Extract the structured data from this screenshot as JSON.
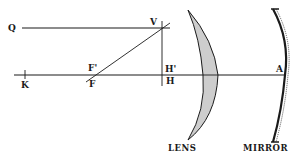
{
  "diagram": {
    "type": "optics ray diagram",
    "labels": {
      "Q": "Q",
      "V": "V",
      "F_prime": "F'",
      "F": "F",
      "K": "K",
      "H_prime": "H'",
      "H": "H",
      "A": "A"
    },
    "captions": {
      "lens": "LENS",
      "mirror": "MIRROR"
    },
    "colors": {
      "ink": "#1a1a1a",
      "background": "#ffffff"
    }
  }
}
